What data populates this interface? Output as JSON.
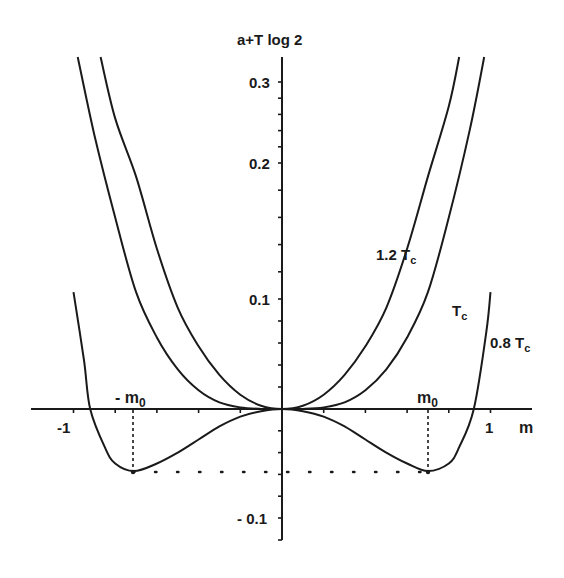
{
  "chart_data": {
    "type": "line",
    "title": "",
    "ylabel": "a + T log 2",
    "xlabel": "m",
    "xlim": [
      -1.2,
      1.2
    ],
    "ylim": [
      -0.12,
      0.33
    ],
    "grid": false,
    "legend": "inline labels on curves",
    "x_ticks": [
      {
        "value": -1,
        "label": "-1"
      },
      {
        "value": 1,
        "label": "1"
      }
    ],
    "x_minor_ticks": [
      -0.8,
      -0.6,
      -0.4,
      -0.2,
      0.2,
      0.4,
      0.6,
      0.8
    ],
    "y_ticks": [
      {
        "value": 0.3,
        "label": "0.3"
      },
      {
        "value": 0.2,
        "label": "0.2"
      },
      {
        "value": 0.1,
        "label": "0.1"
      },
      {
        "value": -0.1,
        "label": "-0.1"
      }
    ],
    "y_pixel_map": [
      {
        "value": -0.12,
        "px": 540
      },
      {
        "value": -0.1,
        "px": 518
      },
      {
        "value": 0.0,
        "px": 409
      },
      {
        "value": 0.1,
        "px": 299
      },
      {
        "value": 0.2,
        "px": 163
      },
      {
        "value": 0.3,
        "px": 82
      },
      {
        "value": 0.33,
        "px": 57
      }
    ],
    "x_pixel_map": {
      "origin_px": 282,
      "px_per_unit": 208.5
    },
    "annotations": [
      {
        "text": "m0",
        "x": 0.7,
        "y": 0.0,
        "note": "minimum position of 0.8 Tc curve"
      },
      {
        "text": "-m0",
        "x": -0.71,
        "y": 0.0
      },
      {
        "text": "dotted line at minimum value",
        "y": -0.057
      }
    ],
    "series": [
      {
        "name": "1.2 Tc",
        "label": "1.2 T",
        "label_sub": "c",
        "x": [
          -0.87,
          -0.8,
          -0.7,
          -0.6,
          -0.5,
          -0.4,
          -0.3,
          -0.2,
          -0.1,
          0,
          0.1,
          0.2,
          0.3,
          0.4,
          0.5,
          0.6,
          0.7,
          0.8,
          0.85
        ],
        "y": [
          0.33,
          0.255,
          0.19,
          0.137,
          0.092,
          0.057,
          0.031,
          0.013,
          0.003,
          0,
          0.003,
          0.013,
          0.031,
          0.057,
          0.092,
          0.137,
          0.19,
          0.27,
          0.33
        ]
      },
      {
        "name": "Tc",
        "label": "T",
        "label_sub": "c",
        "x": [
          -0.98,
          -0.9,
          -0.8,
          -0.7,
          -0.6,
          -0.5,
          -0.4,
          -0.3,
          -0.2,
          -0.1,
          0,
          0.1,
          0.2,
          0.3,
          0.4,
          0.5,
          0.6,
          0.7,
          0.8,
          0.9,
          0.97
        ],
        "y": [
          0.33,
          0.235,
          0.16,
          0.105,
          0.065,
          0.036,
          0.017,
          0.006,
          0.0015,
          0.0001,
          0,
          0.0001,
          0.0015,
          0.006,
          0.017,
          0.036,
          0.065,
          0.105,
          0.16,
          0.24,
          0.33
        ],
        "_": ""
      },
      {
        "name": "0.8 Tc",
        "label": "0.8 T",
        "label_sub": "c",
        "x": [
          -1.0,
          -0.95,
          -0.92,
          -0.85,
          -0.8,
          -0.71,
          -0.6,
          -0.5,
          -0.4,
          -0.3,
          -0.2,
          -0.1,
          0,
          0.1,
          0.2,
          0.3,
          0.4,
          0.5,
          0.6,
          0.7,
          0.8,
          0.85,
          0.92,
          0.98,
          1.0
        ],
        "y": [
          0.105,
          0.045,
          0.0,
          -0.035,
          -0.05,
          -0.057,
          -0.05,
          -0.04,
          -0.028,
          -0.016,
          -0.007,
          -0.002,
          0,
          -0.002,
          -0.007,
          -0.016,
          -0.028,
          -0.04,
          -0.05,
          -0.057,
          -0.05,
          -0.035,
          0.0,
          0.07,
          0.105
        ]
      }
    ]
  },
  "labels": {
    "ylabel": "a+T log 2",
    "xlabel": "m",
    "m0": "m",
    "m0_sub": "0",
    "neg_m0": "- m",
    "neg_m0_sub": "0",
    "curve_1_2": "1.2 T",
    "curve_1_2_sub": "c",
    "curve_1": "T",
    "curve_1_sub": "c",
    "curve_0_8": "0.8 T",
    "curve_0_8_sub": "c",
    "tick_03": "0.3",
    "tick_02": "0.2",
    "tick_01": "0.1",
    "tick_m01": "- 0.1",
    "tick_xm1": "-1",
    "tick_x1": "1"
  }
}
